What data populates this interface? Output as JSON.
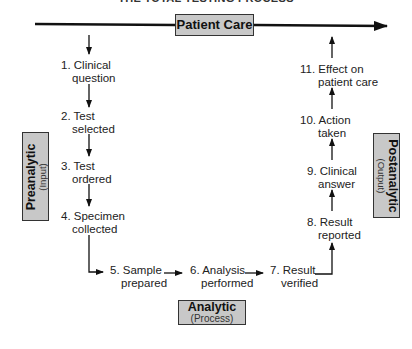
{
  "title": "THE TOTAL TESTING PROCESS",
  "top_bar": {
    "label": "Patient Care"
  },
  "phases": {
    "preanalytic": {
      "label": "Preanalytic",
      "sub": "(Input)"
    },
    "analytic": {
      "label": "Analytic",
      "sub": "(Process)"
    },
    "postanalytic": {
      "label": "Postanalytic",
      "sub": "(Output)"
    }
  },
  "steps": [
    {
      "num": "1.",
      "line1": "Clinical",
      "line2": "question"
    },
    {
      "num": "2.",
      "line1": "Test",
      "line2": "selected"
    },
    {
      "num": "3.",
      "line1": "Test",
      "line2": "ordered"
    },
    {
      "num": "4.",
      "line1": "Specimen",
      "line2": "collected"
    },
    {
      "num": "5.",
      "line1": "Sample",
      "line2": "prepared"
    },
    {
      "num": "6.",
      "line1": "Analysis",
      "line2": "performed"
    },
    {
      "num": "7.",
      "line1": "Result",
      "line2": "verified"
    },
    {
      "num": "8.",
      "line1": "Result",
      "line2": "reported"
    },
    {
      "num": "9.",
      "line1": "Clinical",
      "line2": "answer"
    },
    {
      "num": "10.",
      "line1": "Action",
      "line2": "taken"
    },
    {
      "num": "11.",
      "line1": "Effect on",
      "line2": "patient care"
    }
  ],
  "colors": {
    "box_fill": "#c8c8c8",
    "line": "#111111"
  }
}
